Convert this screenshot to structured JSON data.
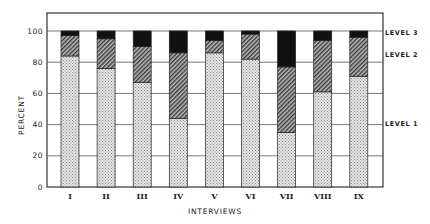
{
  "chart_data": {
    "type": "bar",
    "stacked": true,
    "title": "",
    "xlabel": "INTERVIEWS",
    "ylabel": "PERCENT",
    "ylim": [
      0,
      110
    ],
    "yticks": [
      0,
      20,
      40,
      60,
      80,
      100
    ],
    "grid": true,
    "legend_position": "right",
    "categories": [
      "I",
      "II",
      "III",
      "IV",
      "V",
      "VI",
      "VII",
      "VIII",
      "IX"
    ],
    "series": [
      {
        "name": "LEVEL 1",
        "pattern": "light-dotted",
        "values": [
          84,
          76,
          67,
          44,
          86,
          82,
          35,
          61,
          71
        ]
      },
      {
        "name": "LEVEL 2",
        "pattern": "diagonal-hatch",
        "values": [
          13,
          19,
          23,
          42,
          8,
          16,
          42,
          33,
          25
        ]
      },
      {
        "name": "LEVEL 3",
        "pattern": "solid-black",
        "values": [
          3,
          5,
          10,
          14,
          6,
          2,
          23,
          6,
          4
        ]
      }
    ],
    "colors": {
      "level1": "#d0d0d0",
      "level2": "#7a7a7a",
      "level3": "#111111",
      "frame": "#333333",
      "grid": "#555555"
    }
  }
}
